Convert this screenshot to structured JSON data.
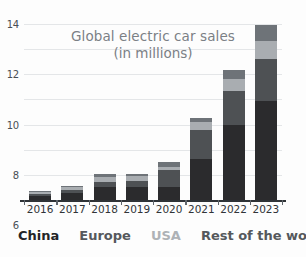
{
  "chart": {
    "title_line1": "Global electric car sales",
    "title_line2": "(in millions)",
    "ylabel": "",
    "xlabel": ""
  },
  "axis": {
    "yticks": [
      "0",
      "2",
      "4",
      "6",
      "8",
      "10",
      "12",
      "14"
    ],
    "ymin": 0,
    "ymax": 14
  },
  "legend": {
    "china": "China",
    "europe": "Europe",
    "usa": "USA",
    "rest_of_world": "Rest of the world"
  },
  "xlabels": [
    "2016",
    "2017",
    "2018",
    "2019",
    "2020",
    "2021",
    "2022",
    "2023"
  ],
  "chart_data": {
    "type": "bar",
    "stacked": true,
    "title": "Global electric car sales (in millions)",
    "subtitle": "(in millions)",
    "xlabel": "",
    "ylabel": "millions of cars",
    "ylim": [
      0,
      14
    ],
    "yticks": [
      0,
      2,
      4,
      6,
      8,
      10,
      12,
      14
    ],
    "grid": true,
    "legend_position": "bottom",
    "categories": [
      "2016",
      "2017",
      "2018",
      "2019",
      "2020",
      "2021",
      "2022",
      "2023"
    ],
    "series": [
      {
        "name": "China",
        "color": "#2b2b2d",
        "values": [
          0.3,
          0.55,
          1.0,
          1.0,
          1.0,
          3.25,
          5.95,
          7.9
        ]
      },
      {
        "name": "Europe",
        "color": "#4e5154",
        "values": [
          0.15,
          0.25,
          0.4,
          0.55,
          1.35,
          2.3,
          2.7,
          3.35
        ]
      },
      {
        "name": "USA",
        "color": "#a9adb1",
        "values": [
          0.15,
          0.2,
          0.4,
          0.35,
          0.3,
          0.65,
          1.0,
          1.4
        ]
      },
      {
        "name": "Rest of the world",
        "color": "#6e7378",
        "values": [
          0.1,
          0.15,
          0.25,
          0.2,
          0.4,
          0.3,
          0.7,
          1.25
        ]
      }
    ],
    "totals": [
      0.7,
      1.15,
      2.05,
      2.1,
      3.05,
      6.5,
      10.35,
      13.9
    ]
  }
}
